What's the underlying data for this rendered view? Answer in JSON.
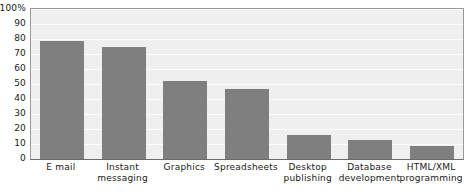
{
  "chart_data": {
    "type": "bar",
    "title": "",
    "xlabel": "",
    "ylabel": "",
    "ylim": [
      0,
      100
    ],
    "grid": true,
    "legend": "none",
    "y_tick_labels": [
      "100%",
      "90",
      "80",
      "70",
      "60",
      "50",
      "40",
      "30",
      "20",
      "10",
      "0"
    ],
    "y_tick_values": [
      100,
      90,
      80,
      70,
      60,
      50,
      40,
      30,
      20,
      10,
      0
    ],
    "categories": [
      "E mail",
      "Instant messaging",
      "Graphics",
      "Spreadsheets",
      "Desktop publishing",
      "Database development",
      "HTML/XML programming"
    ],
    "category_lines": [
      [
        "E mail"
      ],
      [
        "Instant",
        "messaging"
      ],
      [
        "Graphics"
      ],
      [
        "Spreadsheets"
      ],
      [
        "Desktop",
        "publishing"
      ],
      [
        "Database",
        "development"
      ],
      [
        "HTML/XML",
        "programming"
      ]
    ],
    "values": [
      79,
      75,
      52,
      47,
      16,
      13,
      9
    ],
    "bar_color": "#7f7f7f",
    "plot_background_color": "#efefef",
    "gridline_color": "#fbfbfb",
    "axis_color": "#6b6b6b"
  }
}
